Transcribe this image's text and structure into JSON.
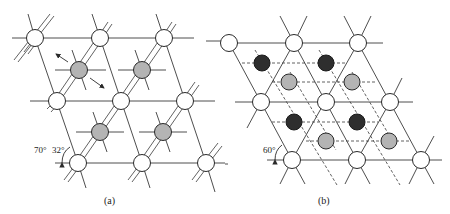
{
  "figure": {
    "panels": [
      {
        "id": "a",
        "caption": "(a)",
        "angle_labels": [
          "70°",
          "32°"
        ],
        "node_types": {
          "white": "lattice-site",
          "gray": "interstitial-site"
        },
        "white_nodes": [
          [
            35,
            38
          ],
          [
            100,
            38
          ],
          [
            164,
            38
          ],
          [
            57,
            101
          ],
          [
            121,
            101
          ],
          [
            185,
            101
          ],
          [
            78,
            163
          ],
          [
            142,
            163
          ],
          [
            206,
            163
          ]
        ],
        "gray_nodes": [
          [
            79,
            70
          ],
          [
            142,
            70
          ],
          [
            100,
            132
          ],
          [
            163,
            132
          ]
        ],
        "arrows": [
          "displacement-arrow-up-left",
          "displacement-arrow-down-right"
        ]
      },
      {
        "id": "b",
        "caption": "(b)",
        "angle_labels": [
          "60°"
        ],
        "node_types": {
          "white": "lattice-site",
          "dark": "sublattice-a-site",
          "gray": "sublattice-b-site"
        },
        "white_nodes": [
          [
            229,
            43
          ],
          [
            294,
            43
          ],
          [
            358,
            43
          ],
          [
            261,
            102
          ],
          [
            326,
            102
          ],
          [
            390,
            102
          ],
          [
            292,
            160
          ],
          [
            357,
            160
          ],
          [
            421,
            160
          ]
        ],
        "dark_nodes": [
          [
            262,
            63
          ],
          [
            326,
            63
          ],
          [
            294,
            122
          ],
          [
            357,
            122
          ]
        ],
        "gray_nodes": [
          [
            289,
            82
          ],
          [
            352,
            82
          ],
          [
            326,
            141
          ],
          [
            389,
            141
          ]
        ]
      }
    ],
    "colors": {
      "line": "#3a3a3a",
      "white_fill": "#ffffff",
      "gray_fill": "#b4b4b4",
      "dark_fill": "#2e2e2e"
    }
  }
}
